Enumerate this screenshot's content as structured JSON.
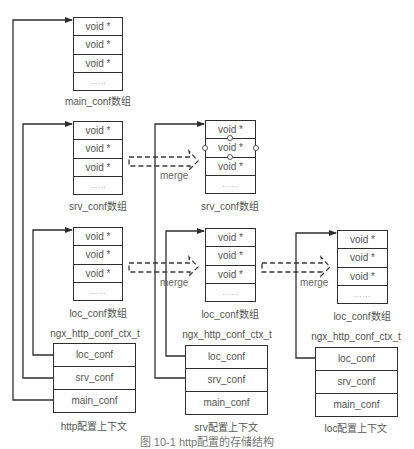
{
  "arrays": {
    "main_conf": {
      "label": "main_conf数组",
      "cells": [
        "void *",
        "void *",
        "void *",
        "……"
      ]
    },
    "http_srv_conf": {
      "label": "srv_conf数组",
      "cells": [
        "void *",
        "void *",
        "void *",
        "……"
      ]
    },
    "http_loc_conf": {
      "label": "loc_conf数组",
      "cells": [
        "void *",
        "void *",
        "void *",
        "……"
      ]
    },
    "srv_srv_conf": {
      "label": "srv_conf数组",
      "cells": [
        "void *",
        "void *",
        "void *",
        "……"
      ]
    },
    "srv_loc_conf": {
      "label": "loc_conf数组",
      "cells": [
        "void *",
        "void *",
        "void *",
        "……"
      ]
    },
    "loc_loc_conf": {
      "label": "loc_conf数组",
      "cells": [
        "void *",
        "void *",
        "void *",
        "……"
      ]
    }
  },
  "contexts": {
    "http": {
      "type_label": "ngx_http_conf_ctx_t",
      "caption": "http配置上下文",
      "fields": [
        "loc_conf",
        "srv_conf",
        "main_conf"
      ]
    },
    "srv": {
      "type_label": "ngx_http_conf_ctx_t",
      "caption": "srv配置上下文",
      "fields": [
        "loc_conf",
        "srv_conf",
        "main_conf"
      ]
    },
    "loc": {
      "type_label": "ngx_http_conf_ctx_t",
      "caption": "loc配置上下文",
      "fields": [
        "loc_conf",
        "srv_conf",
        "main_conf"
      ]
    }
  },
  "merge_labels": [
    "merge",
    "merge",
    "merge"
  ],
  "figure_caption": "图 10-1  http配置的存储结构",
  "colors": {
    "line": "#2e2e2e",
    "text": "#555555",
    "background": "#ffffff"
  }
}
